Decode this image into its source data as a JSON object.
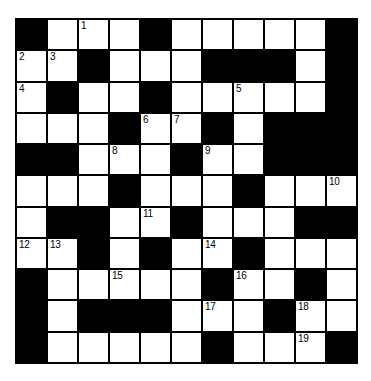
{
  "puzzle": {
    "type": "crossword-grid",
    "rows": 11,
    "columns": 11,
    "colors": {
      "block": "#000000",
      "open": "#ffffff",
      "border": "#000000",
      "number_text": "#000000",
      "page_background": "#ffffff"
    },
    "numbers_visible": [
      "1",
      "2",
      "3",
      "4",
      "5",
      "6",
      "7",
      "8",
      "9",
      "10",
      "11",
      "12",
      "13",
      "14",
      "15",
      "16",
      "17",
      "18",
      "19"
    ],
    "grid": [
      [
        {
          "block": true,
          "number": ""
        },
        {
          "block": false,
          "number": ""
        },
        {
          "block": false,
          "number": "1"
        },
        {
          "block": false,
          "number": ""
        },
        {
          "block": true,
          "number": ""
        },
        {
          "block": false,
          "number": ""
        },
        {
          "block": false,
          "number": ""
        },
        {
          "block": false,
          "number": ""
        },
        {
          "block": false,
          "number": ""
        },
        {
          "block": false,
          "number": ""
        },
        {
          "block": true,
          "number": ""
        }
      ],
      [
        {
          "block": false,
          "number": "2"
        },
        {
          "block": false,
          "number": "3"
        },
        {
          "block": true,
          "number": ""
        },
        {
          "block": false,
          "number": ""
        },
        {
          "block": false,
          "number": ""
        },
        {
          "block": false,
          "number": ""
        },
        {
          "block": true,
          "number": ""
        },
        {
          "block": true,
          "number": ""
        },
        {
          "block": true,
          "number": ""
        },
        {
          "block": false,
          "number": ""
        },
        {
          "block": true,
          "number": ""
        }
      ],
      [
        {
          "block": false,
          "number": "4"
        },
        {
          "block": true,
          "number": ""
        },
        {
          "block": false,
          "number": ""
        },
        {
          "block": false,
          "number": ""
        },
        {
          "block": true,
          "number": ""
        },
        {
          "block": false,
          "number": ""
        },
        {
          "block": false,
          "number": ""
        },
        {
          "block": false,
          "number": "5"
        },
        {
          "block": false,
          "number": ""
        },
        {
          "block": false,
          "number": ""
        },
        {
          "block": true,
          "number": ""
        }
      ],
      [
        {
          "block": false,
          "number": ""
        },
        {
          "block": false,
          "number": ""
        },
        {
          "block": false,
          "number": ""
        },
        {
          "block": true,
          "number": ""
        },
        {
          "block": false,
          "number": "6"
        },
        {
          "block": false,
          "number": "7"
        },
        {
          "block": true,
          "number": ""
        },
        {
          "block": false,
          "number": ""
        },
        {
          "block": true,
          "number": ""
        },
        {
          "block": true,
          "number": ""
        },
        {
          "block": true,
          "number": ""
        }
      ],
      [
        {
          "block": true,
          "number": ""
        },
        {
          "block": true,
          "number": ""
        },
        {
          "block": false,
          "number": ""
        },
        {
          "block": false,
          "number": "8"
        },
        {
          "block": false,
          "number": ""
        },
        {
          "block": true,
          "number": ""
        },
        {
          "block": false,
          "number": "9"
        },
        {
          "block": false,
          "number": ""
        },
        {
          "block": true,
          "number": ""
        },
        {
          "block": true,
          "number": ""
        },
        {
          "block": true,
          "number": ""
        }
      ],
      [
        {
          "block": false,
          "number": ""
        },
        {
          "block": false,
          "number": ""
        },
        {
          "block": false,
          "number": ""
        },
        {
          "block": true,
          "number": ""
        },
        {
          "block": false,
          "number": ""
        },
        {
          "block": false,
          "number": ""
        },
        {
          "block": false,
          "number": ""
        },
        {
          "block": true,
          "number": ""
        },
        {
          "block": false,
          "number": ""
        },
        {
          "block": false,
          "number": ""
        },
        {
          "block": false,
          "number": "10"
        }
      ],
      [
        {
          "block": false,
          "number": ""
        },
        {
          "block": true,
          "number": ""
        },
        {
          "block": true,
          "number": ""
        },
        {
          "block": false,
          "number": ""
        },
        {
          "block": false,
          "number": "11"
        },
        {
          "block": true,
          "number": ""
        },
        {
          "block": false,
          "number": ""
        },
        {
          "block": false,
          "number": ""
        },
        {
          "block": false,
          "number": ""
        },
        {
          "block": true,
          "number": ""
        },
        {
          "block": true,
          "number": ""
        }
      ],
      [
        {
          "block": false,
          "number": "12"
        },
        {
          "block": false,
          "number": "13"
        },
        {
          "block": true,
          "number": ""
        },
        {
          "block": false,
          "number": ""
        },
        {
          "block": true,
          "number": ""
        },
        {
          "block": false,
          "number": ""
        },
        {
          "block": false,
          "number": "14"
        },
        {
          "block": true,
          "number": ""
        },
        {
          "block": false,
          "number": ""
        },
        {
          "block": false,
          "number": ""
        },
        {
          "block": false,
          "number": ""
        }
      ],
      [
        {
          "block": true,
          "number": ""
        },
        {
          "block": false,
          "number": ""
        },
        {
          "block": false,
          "number": ""
        },
        {
          "block": false,
          "number": "15"
        },
        {
          "block": false,
          "number": ""
        },
        {
          "block": false,
          "number": ""
        },
        {
          "block": true,
          "number": ""
        },
        {
          "block": false,
          "number": "16"
        },
        {
          "block": false,
          "number": ""
        },
        {
          "block": true,
          "number": ""
        },
        {
          "block": false,
          "number": ""
        }
      ],
      [
        {
          "block": true,
          "number": ""
        },
        {
          "block": false,
          "number": ""
        },
        {
          "block": true,
          "number": ""
        },
        {
          "block": true,
          "number": ""
        },
        {
          "block": true,
          "number": ""
        },
        {
          "block": false,
          "number": ""
        },
        {
          "block": false,
          "number": "17"
        },
        {
          "block": false,
          "number": ""
        },
        {
          "block": true,
          "number": ""
        },
        {
          "block": false,
          "number": "18"
        },
        {
          "block": false,
          "number": ""
        }
      ],
      [
        {
          "block": true,
          "number": ""
        },
        {
          "block": false,
          "number": ""
        },
        {
          "block": false,
          "number": ""
        },
        {
          "block": false,
          "number": ""
        },
        {
          "block": false,
          "number": ""
        },
        {
          "block": false,
          "number": ""
        },
        {
          "block": true,
          "number": ""
        },
        {
          "block": false,
          "number": ""
        },
        {
          "block": false,
          "number": ""
        },
        {
          "block": false,
          "number": "19"
        },
        {
          "block": true,
          "number": ""
        }
      ]
    ]
  }
}
